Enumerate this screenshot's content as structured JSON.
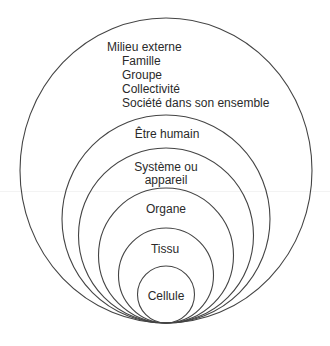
{
  "diagram": {
    "type": "nested-circles",
    "colors": {
      "stroke": "#444444",
      "text": "#2a2a2a",
      "background": "#ffffff"
    },
    "outer": {
      "title": "Milieu externe",
      "items": [
        "Famille",
        "Groupe",
        "Collectivité",
        "Société dans son ensemble"
      ]
    },
    "levels": [
      {
        "label": "Être humain"
      },
      {
        "label_line1": "Système ou",
        "label_line2": "appareil"
      },
      {
        "label": "Organe"
      },
      {
        "label": "Tissu"
      },
      {
        "label": "Cellule"
      }
    ]
  }
}
